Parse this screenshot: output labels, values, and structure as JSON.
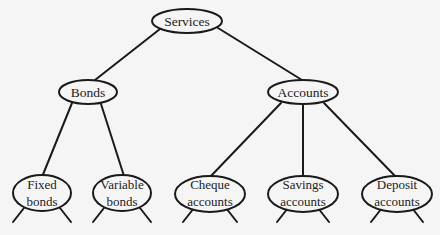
{
  "diagram": {
    "type": "tree",
    "root": {
      "id": "services",
      "label": "Services",
      "children": [
        {
          "id": "bonds",
          "label": "Bonds",
          "children": [
            {
              "id": "fixed_bonds",
              "label_lines": [
                "Fixed",
                "bonds"
              ]
            },
            {
              "id": "variable_bonds",
              "label_lines": [
                "Variable",
                "bonds"
              ]
            }
          ]
        },
        {
          "id": "accounts",
          "label": "Accounts",
          "children": [
            {
              "id": "cheque_accounts",
              "label_lines": [
                "Cheque",
                "accounts"
              ]
            },
            {
              "id": "savings_accounts",
              "label_lines": [
                "Savings",
                "accounts"
              ]
            },
            {
              "id": "deposit_accounts",
              "label_lines": [
                "Deposit",
                "accounts"
              ]
            }
          ]
        }
      ]
    },
    "nodes": {
      "services": {
        "label": "Services"
      },
      "bonds": {
        "label": "Bonds"
      },
      "accounts": {
        "label": "Accounts"
      },
      "fixed_bonds": {
        "line1": "Fixed",
        "line2": "bonds"
      },
      "variable_bonds": {
        "line1": "Variable",
        "line2": "bonds"
      },
      "cheque_accounts": {
        "line1": "Cheque",
        "line2": "accounts"
      },
      "savings_accounts": {
        "line1": "Savings",
        "line2": "accounts"
      },
      "deposit_accounts": {
        "line1": "Deposit",
        "line2": "accounts"
      }
    },
    "colors": {
      "line": "#1a1a1a",
      "background": "#f5f5f5",
      "node_fill": "#f5f5f5"
    }
  }
}
